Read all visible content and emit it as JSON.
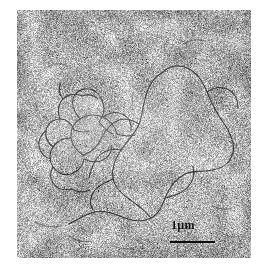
{
  "figure": {
    "kind": "electron-micrograph",
    "background_color": "#ffffff",
    "field": {
      "x": 17,
      "y": 10,
      "width": 234,
      "height": 248,
      "mean_gray": "#b4b4b4",
      "grain": "fine random speckle, high-frequency, gray 0x55-0xF2",
      "filament_color": "#3a3a3a"
    },
    "scalebar": {
      "label": "1µm",
      "bar_length_px": 45,
      "bar_color": "#0d0d0d",
      "label_color": "#141414",
      "position": "lower center-right"
    }
  },
  "chart_data": {
    "type": "scatter",
    "title": "",
    "xlabel": "",
    "ylabel": "",
    "scale_reference": {
      "label": "1µm",
      "bar_length_px": 45,
      "micrometres": 1
    },
    "features": [
      {
        "name": "supercoiled-dna-cluster",
        "region": "center-left",
        "description": "dense tangled knot of thin dark filaments"
      },
      {
        "name": "relaxed-dna-loop",
        "region": "center-right",
        "description": "long extended open contour of a single duplex"
      },
      {
        "name": "background-emulsion-grain",
        "region": "entire-field",
        "description": "uniform fine random speckle"
      }
    ]
  }
}
